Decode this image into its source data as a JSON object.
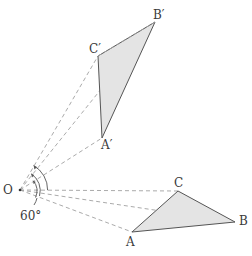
{
  "diagram": {
    "type": "geometry-rotation",
    "colors": {
      "stroke": "#555555",
      "dash": "#9a9a9a",
      "fill": "#e2e2e2"
    },
    "points": {
      "O": {
        "label": "O",
        "x": 20,
        "y": 190
      },
      "A": {
        "label": "A",
        "x": 132,
        "y": 232
      },
      "B": {
        "label": "B",
        "x": 235,
        "y": 222
      },
      "C": {
        "label": "C",
        "x": 178,
        "y": 191
      },
      "A_prime": {
        "label": "A′",
        "x": 102,
        "y": 138
      },
      "B_prime": {
        "label": "B′",
        "x": 155,
        "y": 22
      },
      "C_prime": {
        "label": "C′",
        "x": 98,
        "y": 56
      }
    },
    "angle_label": "60°"
  }
}
